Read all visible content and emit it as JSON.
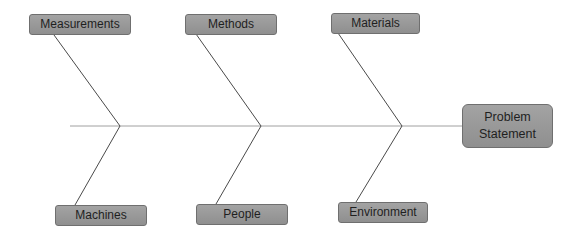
{
  "diagram": {
    "type": "fishbone",
    "head": {
      "label": "Problem Statement",
      "line1": "Problem",
      "line2": "Statement"
    },
    "causes_top": [
      {
        "label": "Measurements"
      },
      {
        "label": "Methods"
      },
      {
        "label": "Materials"
      }
    ],
    "causes_bottom": [
      {
        "label": "Machines"
      },
      {
        "label": "People"
      },
      {
        "label": "Environment"
      }
    ],
    "colors": {
      "box_fill": "#999999",
      "box_border": "#6f6f6f",
      "line": "#555555",
      "spine": "#9a9a9a"
    }
  }
}
